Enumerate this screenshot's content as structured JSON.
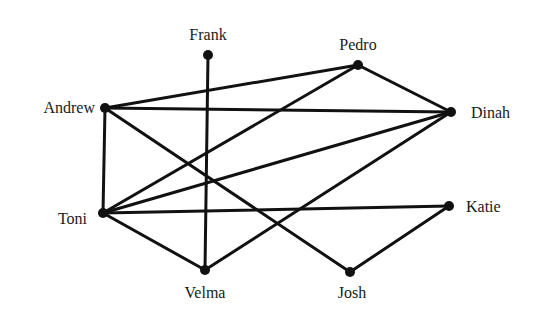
{
  "diagram": {
    "type": "undirected-graph",
    "nodes": [
      {
        "id": "Frank",
        "label": "Frank",
        "x": 208,
        "y": 55,
        "lx": 208,
        "ly": 40,
        "anchor": "middle"
      },
      {
        "id": "Pedro",
        "label": "Pedro",
        "x": 358,
        "y": 65,
        "lx": 358,
        "ly": 50,
        "anchor": "middle"
      },
      {
        "id": "Andrew",
        "label": "Andrew",
        "x": 105,
        "y": 108,
        "lx": 95,
        "ly": 113,
        "anchor": "end"
      },
      {
        "id": "Dinah",
        "label": "Dinah",
        "x": 451,
        "y": 112,
        "lx": 471,
        "ly": 118,
        "anchor": "start"
      },
      {
        "id": "Toni",
        "label": "Toni",
        "x": 103,
        "y": 213,
        "lx": 87,
        "ly": 224,
        "anchor": "end"
      },
      {
        "id": "Katie",
        "label": "Katie",
        "x": 449,
        "y": 206,
        "lx": 466,
        "ly": 212,
        "anchor": "start"
      },
      {
        "id": "Velma",
        "label": "Velma",
        "x": 205,
        "y": 270,
        "lx": 205,
        "ly": 298,
        "anchor": "middle"
      },
      {
        "id": "Josh",
        "label": "Josh",
        "x": 350,
        "y": 272,
        "lx": 352,
        "ly": 298,
        "anchor": "middle"
      }
    ],
    "edges": [
      [
        "Andrew",
        "Pedro"
      ],
      [
        "Andrew",
        "Dinah"
      ],
      [
        "Andrew",
        "Toni"
      ],
      [
        "Andrew",
        "Josh"
      ],
      [
        "Frank",
        "Velma"
      ],
      [
        "Pedro",
        "Dinah"
      ],
      [
        "Pedro",
        "Toni"
      ],
      [
        "Toni",
        "Dinah"
      ],
      [
        "Toni",
        "Katie"
      ],
      [
        "Toni",
        "Velma"
      ],
      [
        "Velma",
        "Dinah"
      ],
      [
        "Josh",
        "Katie"
      ]
    ]
  }
}
